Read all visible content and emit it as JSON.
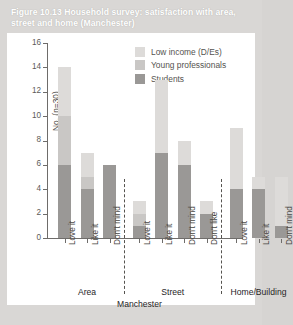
{
  "figure": {
    "caption": "Figure 10.13  Household survey: satisfaction with area, street and home (Manchester)"
  },
  "chart_data": {
    "type": "bar",
    "stacked": true,
    "title": "Figure 10.13  Household survey: satisfaction with area, street and home (Manchester)",
    "xlabel": "Manchester",
    "ylabel": "No. (n=30)",
    "ylim": [
      0,
      16
    ],
    "ytick_step": 2,
    "yticks": [
      0,
      2,
      4,
      6,
      8,
      10,
      12,
      14,
      16
    ],
    "grid": false,
    "legend_position": "top-right",
    "categories": [
      "Love it",
      "Like it",
      "Don't mind",
      "Love it",
      "Like it",
      "Don't mind",
      "Don't like",
      "Love it",
      "Like it",
      "Don't mind"
    ],
    "groups": [
      {
        "label": "Area",
        "categories": [
          "Love it",
          "Like it",
          "Don't mind"
        ]
      },
      {
        "label": "Street",
        "categories": [
          "Love it",
          "Like it",
          "Don't mind",
          "Don't like"
        ]
      },
      {
        "label": "Home/Building",
        "categories": [
          "Love it",
          "Like it",
          "Don't mind"
        ]
      }
    ],
    "series": [
      {
        "name": "Students",
        "color": "#9a9896",
        "values": [
          6,
          4,
          6,
          1,
          7,
          6,
          2,
          4,
          4,
          1
        ]
      },
      {
        "name": "Young professionals",
        "color": "#c9c7c5",
        "values": [
          4,
          1,
          0,
          1,
          0,
          0,
          0,
          0,
          0,
          0
        ]
      },
      {
        "name": "Low income (D/Es)",
        "color": "#dddbd9",
        "values": [
          4,
          2,
          0,
          1,
          6,
          2,
          1,
          5,
          1,
          4
        ]
      }
    ],
    "totals": [
      14,
      7,
      6,
      3,
      13,
      8,
      3,
      9,
      5,
      5
    ]
  },
  "legend": {
    "items": [
      {
        "label": "Low income (D/Es)",
        "color": "#dddbd9"
      },
      {
        "label": "Young professionals",
        "color": "#c9c7c5"
      },
      {
        "label": "Students",
        "color": "#9a9896"
      }
    ]
  },
  "axis": {
    "y_label": "No. (n=30)",
    "y_ticks": [
      "0",
      "2",
      "4",
      "6",
      "8",
      "10",
      "12",
      "14",
      "16"
    ],
    "x_overall_label": "Manchester",
    "group_labels": [
      "Area",
      "Street",
      "Home/Building"
    ],
    "x_tick_labels": [
      "Love it",
      "Like it",
      "Don't mind",
      "Love it",
      "Like it",
      "Don't mind",
      "Don't like",
      "Love it",
      "Like it",
      "Don't mind"
    ]
  }
}
